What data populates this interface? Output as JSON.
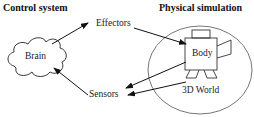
{
  "headers": {
    "left": "Control system",
    "right": "Physical simulation"
  },
  "nodes": {
    "brain": "Brain",
    "effectors": "Effectors",
    "sensors": "Sensors",
    "body": "Body",
    "world": "3D World"
  },
  "edges": [
    {
      "from": "Brain",
      "to": "Effectors"
    },
    {
      "from": "Effectors",
      "to": "Body"
    },
    {
      "from": "Body",
      "to": "Sensors"
    },
    {
      "from": "3D World",
      "to": "Sensors"
    },
    {
      "from": "Sensors",
      "to": "Brain"
    }
  ],
  "colors": {
    "stroke": "#111111",
    "ellipse": "#555555",
    "text": "#222222"
  }
}
